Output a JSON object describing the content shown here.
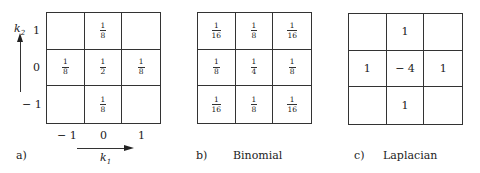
{
  "panels": {
    "a": {
      "tag": "a)",
      "caption": "",
      "cells": [
        [
          "",
          {
            "num": "1",
            "den": "8"
          },
          ""
        ],
        [
          {
            "num": "1",
            "den": "8"
          },
          {
            "num": "1",
            "den": "2"
          },
          {
            "num": "1",
            "den": "8"
          }
        ],
        [
          "",
          {
            "num": "1",
            "den": "8"
          },
          ""
        ]
      ],
      "y_axis": {
        "label": "k",
        "sub": "2",
        "ticks": [
          "1",
          "0",
          "− 1"
        ]
      },
      "x_axis": {
        "label": "k",
        "sub": "1",
        "ticks": [
          "− 1",
          "0",
          "1"
        ]
      }
    },
    "b": {
      "tag": "b)",
      "caption": "Binomial",
      "cells": [
        [
          {
            "num": "1",
            "den": "16"
          },
          {
            "num": "1",
            "den": "8"
          },
          {
            "num": "1",
            "den": "16"
          }
        ],
        [
          {
            "num": "1",
            "den": "8"
          },
          {
            "num": "1",
            "den": "4"
          },
          {
            "num": "1",
            "den": "8"
          }
        ],
        [
          {
            "num": "1",
            "den": "16"
          },
          {
            "num": "1",
            "den": "8"
          },
          {
            "num": "1",
            "den": "16"
          }
        ]
      ]
    },
    "c": {
      "tag": "c)",
      "caption": "Laplacian",
      "cells": [
        [
          "",
          "1",
          ""
        ],
        [
          "1",
          "− 4",
          "1"
        ],
        [
          "",
          "1",
          ""
        ]
      ]
    }
  }
}
